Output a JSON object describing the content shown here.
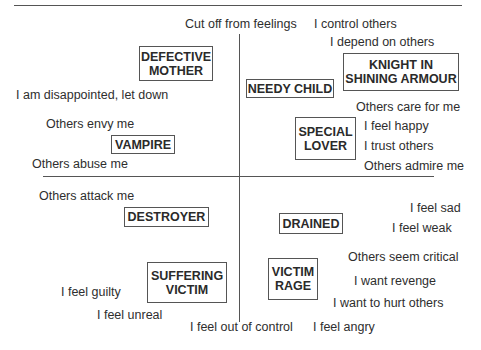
{
  "diagram": {
    "boxes": {
      "defective_mother": [
        "DEFECTIVE",
        "MOTHER"
      ],
      "knight": [
        "KNIGHT IN",
        "SHINING ARMOUR"
      ],
      "needy_child": "NEEDY CHILD",
      "special_lover": [
        "SPECIAL",
        "LOVER"
      ],
      "vampire": "VAMPIRE",
      "destroyer": "DESTROYER",
      "drained": "DRAINED",
      "suffering_victim": [
        "SUFFERING",
        "VICTIM"
      ],
      "victim_rage": [
        "VICTIM",
        "RAGE"
      ]
    },
    "labels": {
      "cut_off": "Cut off from feelings",
      "control_others": "I control others",
      "depend_on_others": "I depend on others",
      "disappointed": "I am disappointed, let down",
      "others_care": "Others care for me",
      "others_envy": "Others envy me",
      "feel_happy": "I feel happy",
      "trust_others": "I trust others",
      "others_abuse": "Others abuse me",
      "others_admire": "Others admire me",
      "others_attack": "Others attack me",
      "feel_sad": "I feel sad",
      "feel_weak": "I feel weak",
      "others_critical": "Others seem critical",
      "want_revenge": "I want revenge",
      "feel_guilty": "I feel guilty",
      "hurt_others": "I want to hurt others",
      "feel_unreal": "I feel unreal",
      "out_of_control": "I feel out of control",
      "feel_angry": "I feel angry"
    }
  }
}
